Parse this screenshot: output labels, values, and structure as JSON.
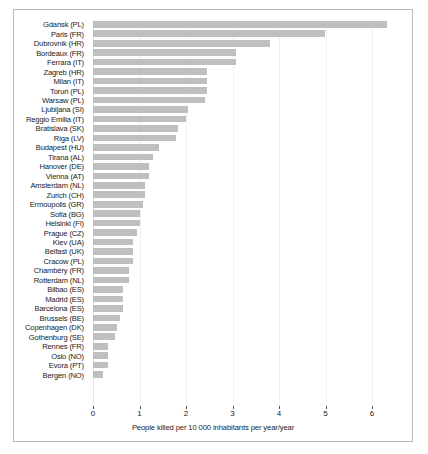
{
  "chart_data": {
    "type": "bar",
    "orientation": "horizontal",
    "title": "",
    "xlabel": "People killed per 10 000 inhabitants per year/year",
    "ylabel": "",
    "xlim": [
      0,
      6.6
    ],
    "xticks": [
      0,
      1,
      2,
      3,
      4,
      5,
      6
    ],
    "xticklabels": [
      "0",
      "1",
      "2",
      "3",
      "4",
      "5",
      "6"
    ],
    "grid": true,
    "grid_axis": "x",
    "legend": null,
    "bar_color": "#bfbfbf",
    "categories": [
      "Gdańsk (PL)",
      "Paris (FR)",
      "Dubrovnik (HR)",
      "Bordeaux (FR)",
      "Ferrara (IT)",
      "Zagreb (HR)",
      "Milan (IT)",
      "Toruń (PL)",
      "Warsaw (PL)",
      "Ljubljana (SI)",
      "Reggio Emilia (IT)",
      "Bratislava (SK)",
      "Riga (LV)",
      "Budapest (HU)",
      "Tirana (AL)",
      "Hanover (DE)",
      "Vienna (AT)",
      "Amsterdam (NL)",
      "Zurich (CH)",
      "Ermoupolis (GR)",
      "Sofia (BG)",
      "Helsinki (FI)",
      "Prague (CZ)",
      "Kiev (UA)",
      "Belfast (UK)",
      "Cracow (PL)",
      "Chambéry (FR)",
      "Rotterdam (NL)",
      "Bilbao (ES)",
      "Madrid (ES)",
      "Barcelona (ES)",
      "Brussels (BE)",
      "Copenhagen (DK)",
      "Gothenburg (SE)",
      "Rennes (FR)",
      "Oslo (NO)",
      "Evora (PT)",
      "Bergen (NO)"
    ],
    "values": [
      6.33,
      4.98,
      3.8,
      3.08,
      3.08,
      2.45,
      2.45,
      2.45,
      2.4,
      2.05,
      2.0,
      1.82,
      1.78,
      1.42,
      1.3,
      1.2,
      1.2,
      1.12,
      1.12,
      1.08,
      1.02,
      1.02,
      0.95,
      0.85,
      0.85,
      0.85,
      0.78,
      0.78,
      0.65,
      0.65,
      0.65,
      0.58,
      0.52,
      0.48,
      0.32,
      0.32,
      0.32,
      0.22
    ]
  }
}
